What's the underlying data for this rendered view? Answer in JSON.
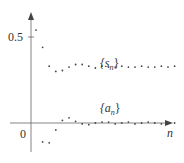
{
  "chart_data": {
    "type": "scatter",
    "title": "",
    "xlabel": "n",
    "ylabel": "",
    "y_ticks": [
      {
        "value": 0.5,
        "label": "0.5"
      }
    ],
    "origin_label": "0",
    "ylim": [
      -0.12,
      0.64
    ],
    "grid": false,
    "legend": "inline labels",
    "series": [
      {
        "name": "{s_n}",
        "label": "{s",
        "label_sub": "n",
        "label_close": "}",
        "x": [
          1,
          2,
          3,
          4,
          5,
          6,
          7,
          8,
          9,
          10,
          11,
          12,
          13,
          14,
          15,
          16,
          17,
          18,
          19,
          20,
          21,
          22
        ],
        "values": [
          0.54,
          0.44,
          0.33,
          0.3,
          0.305,
          0.325,
          0.34,
          0.34,
          0.33,
          0.32,
          0.33,
          0.325,
          0.325,
          0.33,
          0.325,
          0.325,
          0.33,
          0.325,
          0.325,
          0.33,
          0.325,
          0.33
        ]
      },
      {
        "name": "{a_n}",
        "label": "{a",
        "label_sub": "n",
        "label_close": "}",
        "x": [
          1,
          2,
          3,
          4,
          5,
          6,
          7,
          8,
          9,
          10,
          11,
          12,
          13,
          14,
          15,
          16,
          17,
          18,
          19,
          20,
          21,
          22
        ],
        "values": [
          0.54,
          -0.11,
          -0.115,
          -0.04,
          0.015,
          0.03,
          0.01,
          -0.005,
          -0.01,
          0.0,
          0.005,
          0.005,
          -0.005,
          0.0,
          0.005,
          -0.005,
          0.0,
          0.005,
          0.0,
          -0.005,
          0.0,
          0.0
        ]
      }
    ]
  },
  "colors": {
    "axis": "#555555",
    "points": "#444444",
    "text": "#333333"
  }
}
